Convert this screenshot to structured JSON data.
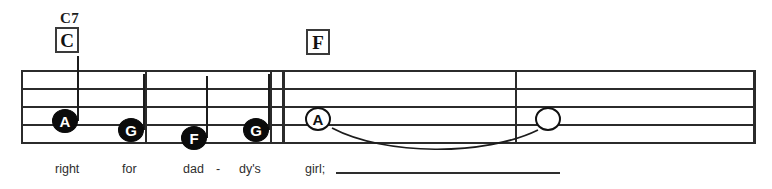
{
  "sheet": {
    "title": "",
    "ink_color": "#1c1c1c",
    "paper_color": "#ffffff",
    "system": {
      "staff_left": 21,
      "staff_right": 756,
      "staff_line_ys": [
        70,
        88,
        106,
        124,
        142
      ],
      "line_count": 5
    }
  },
  "chords": [
    {
      "name": "C7",
      "boxed_letter": "C",
      "name_x": 60,
      "name_y": 10,
      "box_x": 55,
      "box_y": 27
    },
    {
      "name": "",
      "boxed_letter": "F",
      "name_x": 0,
      "name_y": 0,
      "box_x": 306,
      "box_y": 29
    }
  ],
  "barlines": [
    {
      "x": 21,
      "kind": "start",
      "thickness": 2
    },
    {
      "x": 145,
      "kind": "single",
      "thickness": 2
    },
    {
      "x": 270,
      "kind": "double-thin",
      "thickness": 2
    },
    {
      "x": 282,
      "kind": "double-thick",
      "thickness": 3
    },
    {
      "x": 515,
      "kind": "single",
      "thickness": 2
    },
    {
      "x": 753,
      "kind": "end",
      "thickness": 3
    }
  ],
  "notes": [
    {
      "label": "A",
      "head": "filled",
      "x": 65,
      "y": 121,
      "stem": "up",
      "stem_height": 65,
      "stem_side": "right"
    },
    {
      "label": "G",
      "head": "filled",
      "x": 131,
      "y": 130,
      "stem": "up",
      "stem_height": 56,
      "stem_side": "right"
    },
    {
      "label": "F",
      "head": "filled",
      "x": 194,
      "y": 138,
      "stem": "up",
      "stem_height": 62,
      "stem_side": "right"
    },
    {
      "label": "G",
      "head": "filled",
      "x": 256,
      "y": 130,
      "stem": "up",
      "stem_height": 56,
      "stem_side": "right"
    },
    {
      "label": "A",
      "head": "hollow",
      "x": 318,
      "y": 119,
      "stem": "none",
      "stem_height": 0,
      "stem_side": "none"
    },
    {
      "label": "",
      "head": "hollow",
      "x": 548,
      "y": 119,
      "stem": "none",
      "stem_height": 0,
      "stem_side": "none"
    }
  ],
  "ties": [
    {
      "from_note": 4,
      "to_note": 5,
      "x": 330,
      "y": 128,
      "width": 208,
      "depth": 22,
      "direction": "down"
    }
  ],
  "lyrics": {
    "baseline_y": 163,
    "syllables": [
      {
        "text": "right",
        "x": 55
      },
      {
        "text": "for",
        "x": 122
      },
      {
        "text": "dad",
        "x": 183
      },
      {
        "text": "-",
        "x": 216
      },
      {
        "text": "dy's",
        "x": 239
      },
      {
        "text": "girl;",
        "x": 305
      }
    ],
    "extender": {
      "x": 336,
      "y": 172,
      "width": 224
    }
  }
}
